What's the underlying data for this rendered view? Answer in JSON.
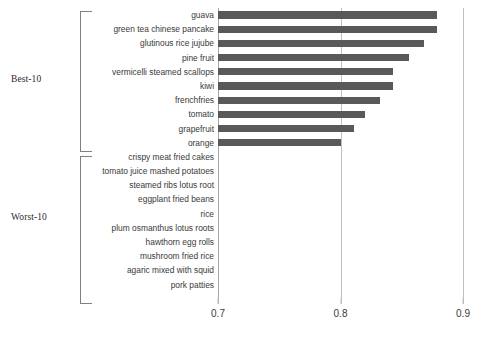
{
  "chart_data": {
    "type": "bar",
    "orientation": "horizontal",
    "title": "",
    "xlabel": "",
    "ylabel": "",
    "xlim": [
      0.7,
      0.9
    ],
    "xticks": [
      "0.7",
      "0.8",
      "0.9"
    ],
    "xtick_values": [
      0.7,
      0.8,
      0.9
    ],
    "grid": true,
    "legend": false,
    "bar_color": "#595959",
    "axis_color": "#bfbfbf",
    "groups": [
      {
        "label": "Best-10",
        "start_index": 0,
        "end_index": 9
      },
      {
        "label": "Worst-10",
        "start_index": 10,
        "end_index": 19
      }
    ],
    "categories": [
      "guava",
      "green tea chinese pancake",
      "glutinous rice jujube",
      "pine fruit",
      "vermicelli steamed scallops",
      "kiwi",
      "frenchfries",
      "tomato",
      "grapefruit",
      "orange",
      "crispy meat fried cakes",
      "tomato juice mashed potatoes",
      "steamed ribs lotus root",
      "eggplant fried beans",
      "rice",
      "plum osmanthus lotus roots",
      "hawthorn egg rolls",
      "mushroom fried rice",
      "agaric mixed with squid",
      "pork patties"
    ],
    "values": [
      0.879,
      0.879,
      0.868,
      0.856,
      0.843,
      0.843,
      0.832,
      0.82,
      0.811,
      0.8,
      null,
      null,
      null,
      null,
      null,
      null,
      null,
      null,
      null,
      null
    ]
  }
}
